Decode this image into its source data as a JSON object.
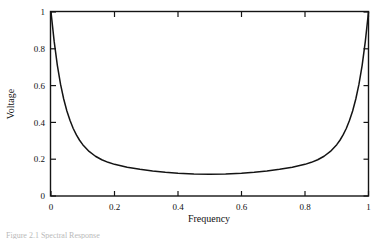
{
  "figure": {
    "caption": "Figure 2.1   Spectral Response"
  },
  "chart_data": {
    "type": "line",
    "title": "",
    "xlabel": "Frequency",
    "ylabel": "Voltage",
    "xlim": [
      0,
      1
    ],
    "ylim": [
      0,
      1
    ],
    "grid": false,
    "legend": "none",
    "line_color": "#141414",
    "xticks": [
      0,
      0.2,
      0.4,
      0.6,
      0.8,
      1
    ],
    "xtick_labels": [
      "0",
      "0.2",
      "0.4",
      "0.6",
      "0.8",
      "1"
    ],
    "yticks": [
      0,
      0.2,
      0.4,
      0.6,
      0.8,
      1
    ],
    "ytick_labels": [
      "0",
      "0.2",
      "0.4",
      "0.6",
      "0.8",
      "1"
    ],
    "series": [
      {
        "name": "Voltage",
        "x": [
          0.0,
          0.01,
          0.02,
          0.03,
          0.04,
          0.05,
          0.06,
          0.07,
          0.08,
          0.09,
          0.1,
          0.12,
          0.14,
          0.16,
          0.18,
          0.2,
          0.24,
          0.28,
          0.32,
          0.36,
          0.4,
          0.45,
          0.5,
          0.55,
          0.6,
          0.64,
          0.68,
          0.72,
          0.76,
          0.8,
          0.82,
          0.84,
          0.86,
          0.88,
          0.9,
          0.91,
          0.92,
          0.93,
          0.94,
          0.95,
          0.96,
          0.97,
          0.98,
          0.99,
          1.0
        ],
        "y": [
          1.0,
          0.84,
          0.71,
          0.608,
          0.527,
          0.462,
          0.41,
          0.367,
          0.332,
          0.303,
          0.279,
          0.242,
          0.216,
          0.197,
          0.183,
          0.172,
          0.156,
          0.145,
          0.136,
          0.129,
          0.124,
          0.12,
          0.118,
          0.12,
          0.124,
          0.129,
          0.136,
          0.145,
          0.156,
          0.172,
          0.183,
          0.197,
          0.216,
          0.242,
          0.279,
          0.303,
          0.332,
          0.367,
          0.41,
          0.462,
          0.527,
          0.608,
          0.71,
          0.84,
          1.0
        ]
      }
    ],
    "minimum": {
      "x": 0.5,
      "y": 0.118
    },
    "endpoints": [
      {
        "x": 0,
        "y": 1
      },
      {
        "x": 1,
        "y": 1
      }
    ]
  }
}
